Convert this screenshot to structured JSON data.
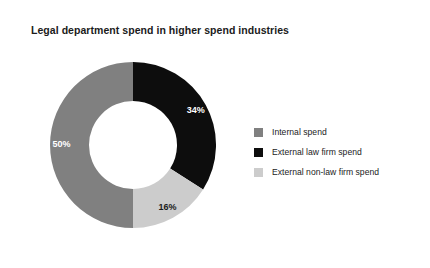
{
  "chart_data": {
    "type": "pie",
    "variant": "donut",
    "title": "Legal department spend in higher spend industries",
    "xlabel": "",
    "ylabel": "",
    "grid": false,
    "legend_position": "right",
    "units": "percent",
    "total": 100,
    "categories": [
      "Internal spend",
      "External law firm spend",
      "External non-law firm spend"
    ],
    "values": [
      50,
      34,
      16
    ],
    "labels": [
      "50%",
      "34%",
      "16%"
    ],
    "colors": [
      "#808080",
      "#0d0d0d",
      "#cccccc"
    ],
    "label_colors": [
      "#ffffff",
      "#ffffff",
      "#1b1b1b"
    ],
    "slices": [
      {
        "name": "Internal spend",
        "value": 50,
        "label": "50%",
        "color": "#808080",
        "label_color": "#ffffff",
        "start_angle": 180,
        "end_angle": 360
      },
      {
        "name": "External law firm spend",
        "value": 34,
        "label": "34%",
        "color": "#0d0d0d",
        "label_color": "#ffffff",
        "start_angle": 0,
        "end_angle": 122.4
      },
      {
        "name": "External non-law firm spend",
        "value": 16,
        "label": "16%",
        "color": "#cccccc",
        "label_color": "#1b1b1b",
        "start_angle": 122.4,
        "end_angle": 180
      }
    ]
  },
  "legend": {
    "items": [
      {
        "label": "Internal spend",
        "color": "#808080"
      },
      {
        "label": "External law firm spend",
        "color": "#0d0d0d"
      },
      {
        "label": "External non-law firm spend",
        "color": "#cccccc"
      }
    ]
  },
  "canvas": {
    "background": "#ffffff",
    "title_color": "#1b1b1b"
  }
}
